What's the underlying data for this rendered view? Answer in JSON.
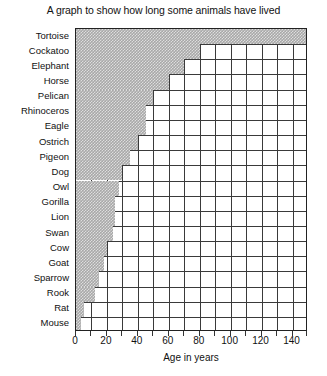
{
  "chart_data": {
    "type": "bar",
    "orientation": "horizontal",
    "title": "A graph to show how long some animals have lived",
    "xlabel": "Age in years",
    "ylabel": "",
    "xlim": [
      0,
      150
    ],
    "ylim": null,
    "grid": true,
    "legend": null,
    "x_ticks": [
      0,
      20,
      40,
      60,
      80,
      100,
      120,
      140
    ],
    "x_tick_labels": [
      "0",
      "20",
      "40",
      "60",
      "80",
      "100",
      "120",
      "140"
    ],
    "x_minor_tick_step": 10,
    "bar_fill": "#a8a8a8",
    "bar_pattern": "hatched",
    "categories": [
      "Tortoise",
      "Cockatoo",
      "Elephant",
      "Horse",
      "Pelican",
      "Rhinoceros",
      "Eagle",
      "Ostrich",
      "Pigeon",
      "Dog",
      "Owl",
      "Gorilla",
      "Lion",
      "Swan",
      "Cow",
      "Goat",
      "Sparrow",
      "Rook",
      "Rat",
      "Mouse"
    ],
    "values": [
      150,
      80,
      70,
      60,
      50,
      45,
      45,
      40,
      35,
      30,
      28,
      25,
      25,
      24,
      20,
      18,
      15,
      12,
      5,
      3
    ]
  }
}
